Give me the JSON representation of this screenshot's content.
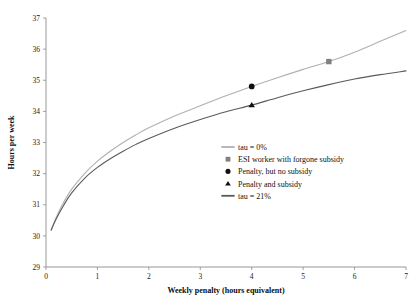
{
  "chart_data": {
    "type": "line",
    "title": "",
    "xlabel": "Weekly penalty (hours equivalent)",
    "ylabel": "Hours per week",
    "xlim": [
      0,
      7
    ],
    "ylim": [
      29,
      37
    ],
    "xticks": [
      "0",
      "1",
      "2",
      "3",
      "4",
      "5",
      "6",
      "7"
    ],
    "yticks": [
      "29",
      "30",
      "31",
      "32",
      "33",
      "34",
      "35",
      "36",
      "37"
    ],
    "grid": false,
    "legend_position": "center-right",
    "series": [
      {
        "name": "tau = 0%",
        "type": "line",
        "color": "#b0b0b0",
        "x": [
          0.1,
          0.2,
          0.35,
          0.5,
          0.75,
          1.0,
          1.25,
          1.5,
          1.75,
          2.0,
          2.5,
          3.0,
          3.5,
          4.0,
          4.5,
          5.0,
          5.5,
          6.0,
          6.5,
          7.0
        ],
        "y": [
          30.2,
          30.6,
          31.1,
          31.5,
          32.0,
          32.4,
          32.72,
          33.0,
          33.25,
          33.47,
          33.85,
          34.18,
          34.5,
          34.8,
          35.08,
          35.35,
          35.6,
          35.9,
          36.25,
          36.6
        ]
      },
      {
        "name": "tau = 21%",
        "type": "line",
        "color": "#5a5a5a",
        "x": [
          0.1,
          0.2,
          0.35,
          0.5,
          0.75,
          1.0,
          1.25,
          1.5,
          1.75,
          2.0,
          2.5,
          3.0,
          3.5,
          4.0,
          4.5,
          5.0,
          5.5,
          6.0,
          6.5,
          7.0
        ],
        "y": [
          30.18,
          30.55,
          31.0,
          31.38,
          31.85,
          32.2,
          32.48,
          32.72,
          32.94,
          33.13,
          33.46,
          33.74,
          33.99,
          34.2,
          34.44,
          34.66,
          34.86,
          35.04,
          35.18,
          35.3
        ]
      }
    ],
    "points": [
      {
        "name": "ESI worker with forgone subsidy",
        "marker": "square",
        "color": "#808080",
        "x": 5.5,
        "y": 35.6
      },
      {
        "name": "Penalty, but no subsidy",
        "marker": "circle",
        "color": "#111111",
        "x": 4.0,
        "y": 34.8
      },
      {
        "name": "Penalty and subsidy",
        "marker": "triangle",
        "color": "#111111",
        "x": 4.0,
        "y": 34.2
      }
    ],
    "legend": [
      {
        "label": "tau = 0%",
        "marker": "line",
        "color": "#b0b0b0"
      },
      {
        "label": "ESI worker with forgone subsidy",
        "marker": "square",
        "color": "#808080"
      },
      {
        "label": "Penalty, but no subsidy",
        "marker": "circle",
        "color": "#111111"
      },
      {
        "label": "Penalty and subsidy",
        "marker": "triangle",
        "color": "#111111"
      },
      {
        "label": "tau = 21%",
        "marker": "line",
        "color": "#5a5a5a"
      }
    ]
  }
}
